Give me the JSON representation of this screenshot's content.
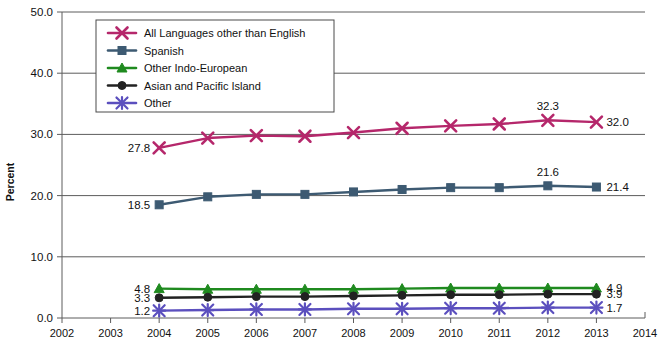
{
  "chart_data": {
    "type": "line",
    "title": "",
    "xlabel": "",
    "ylabel": "Percent",
    "grid": true,
    "legend_position": "top-left-inside",
    "x": [
      2004,
      2005,
      2006,
      2007,
      2008,
      2009,
      2010,
      2011,
      2012,
      2013
    ],
    "xlim": [
      2002,
      2014
    ],
    "ylim": [
      0.0,
      50.0
    ],
    "xticks": [
      "2002",
      "2003",
      "2004",
      "2005",
      "2006",
      "2007",
      "2008",
      "2009",
      "2010",
      "2011",
      "2012",
      "2013",
      "2014"
    ],
    "yticks": [
      "0.0",
      "10.0",
      "20.0",
      "30.0",
      "40.0",
      "50.0"
    ],
    "series": [
      {
        "name": "All Languages other than English",
        "color": "#b5276b",
        "marker": "x-cross",
        "values": [
          27.8,
          29.4,
          29.8,
          29.7,
          30.3,
          31.0,
          31.4,
          31.7,
          32.3,
          32.0
        ],
        "point_labels": {
          "2004": "27.8",
          "2012": "32.3",
          "2013": "32.0"
        }
      },
      {
        "name": "Spanish",
        "color": "#3d5a72",
        "marker": "square",
        "values": [
          18.5,
          19.8,
          20.2,
          20.2,
          20.6,
          21.0,
          21.3,
          21.3,
          21.6,
          21.4
        ],
        "point_labels": {
          "2004": "18.5",
          "2012": "21.6",
          "2013": "21.4"
        }
      },
      {
        "name": "Other Indo-European",
        "color": "#1f8a1f",
        "marker": "triangle",
        "values": [
          4.8,
          4.7,
          4.7,
          4.7,
          4.7,
          4.8,
          4.9,
          4.9,
          4.9,
          4.9
        ],
        "point_labels": {
          "2004": "4.8",
          "2013": "4.9"
        }
      },
      {
        "name": "Asian and Pacific Island",
        "color": "#222222",
        "marker": "circle",
        "values": [
          3.3,
          3.4,
          3.5,
          3.5,
          3.6,
          3.7,
          3.8,
          3.8,
          3.9,
          3.9
        ],
        "point_labels": {
          "2004": "3.3",
          "2013": "3.9"
        }
      },
      {
        "name": "Other",
        "color": "#5b4fbe",
        "marker": "asterisk",
        "values": [
          1.2,
          1.3,
          1.4,
          1.4,
          1.5,
          1.5,
          1.6,
          1.6,
          1.7,
          1.7
        ],
        "point_labels": {
          "2004": "1.2",
          "2013": "1.7"
        }
      }
    ]
  },
  "axis": {
    "y_title": "Percent"
  }
}
